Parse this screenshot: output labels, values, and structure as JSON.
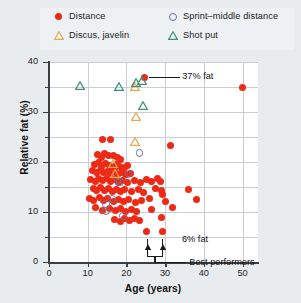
{
  "chart_data": {
    "type": "scatter",
    "title": "",
    "xlabel": "Age (years)",
    "ylabel": "Relative fat (%)",
    "xlim": [
      0,
      54
    ],
    "ylim": [
      0,
      40
    ],
    "xticks": [
      0,
      10,
      20,
      30,
      40,
      50
    ],
    "yticks": [
      0,
      10,
      20,
      30,
      40
    ],
    "yticks_minor": [
      5,
      15,
      25,
      35
    ],
    "grid": "both, light gray at every 5 units of y and every 10 units of x",
    "legend_position": "above plot, two columns",
    "series": [
      {
        "name": "Distance",
        "marker": "filled-circle",
        "color": "#ee2a17",
        "points": [
          [
            24.6,
            37.0
          ],
          [
            50.0,
            35.0
          ],
          [
            31.5,
            23.4
          ],
          [
            13.8,
            24.6
          ],
          [
            16.0,
            24.5
          ],
          [
            12.6,
            21.6
          ],
          [
            13.6,
            21.0
          ],
          [
            14.3,
            21.8
          ],
          [
            15.4,
            21.3
          ],
          [
            16.6,
            21.4
          ],
          [
            17.6,
            21.0
          ],
          [
            18.6,
            20.6
          ],
          [
            11.8,
            19.6
          ],
          [
            12.8,
            19.9
          ],
          [
            13.5,
            19.2
          ],
          [
            14.6,
            19.8
          ],
          [
            15.6,
            19.4
          ],
          [
            16.4,
            19.0
          ],
          [
            17.4,
            19.6
          ],
          [
            18.2,
            19.2
          ],
          [
            19.4,
            19.0
          ],
          [
            20.4,
            19.4
          ],
          [
            11.2,
            18.3
          ],
          [
            12.2,
            18.0
          ],
          [
            13.2,
            18.4
          ],
          [
            14.0,
            17.9
          ],
          [
            15.0,
            18.2
          ],
          [
            15.9,
            17.7
          ],
          [
            16.8,
            18.1
          ],
          [
            17.8,
            17.6
          ],
          [
            18.8,
            18.0
          ],
          [
            19.8,
            17.5
          ],
          [
            21.0,
            17.8
          ],
          [
            10.8,
            16.6
          ],
          [
            11.9,
            16.2
          ],
          [
            12.9,
            16.8
          ],
          [
            13.9,
            16.3
          ],
          [
            14.8,
            16.7
          ],
          [
            15.8,
            16.1
          ],
          [
            16.9,
            16.5
          ],
          [
            17.9,
            16.0
          ],
          [
            19.0,
            16.4
          ],
          [
            20.2,
            16.0
          ],
          [
            22.0,
            16.3
          ],
          [
            23.6,
            16.0
          ],
          [
            25.2,
            16.5
          ],
          [
            26.6,
            16.2
          ],
          [
            28.0,
            16.7
          ],
          [
            28.8,
            16.1
          ],
          [
            11.4,
            14.8
          ],
          [
            12.4,
            14.4
          ],
          [
            13.4,
            14.9
          ],
          [
            14.4,
            14.3
          ],
          [
            15.4,
            14.7
          ],
          [
            16.4,
            14.2
          ],
          [
            17.4,
            14.6
          ],
          [
            18.4,
            14.1
          ],
          [
            19.6,
            14.5
          ],
          [
            21.4,
            14.2
          ],
          [
            23.0,
            14.6
          ],
          [
            24.4,
            14.0
          ],
          [
            27.6,
            14.8
          ],
          [
            29.0,
            14.4
          ],
          [
            29.4,
            13.6
          ],
          [
            36.0,
            14.5
          ],
          [
            10.4,
            12.8
          ],
          [
            11.6,
            12.4
          ],
          [
            13.0,
            12.9
          ],
          [
            14.2,
            12.3
          ],
          [
            15.2,
            12.7
          ],
          [
            16.6,
            12.2
          ],
          [
            18.0,
            12.6
          ],
          [
            19.2,
            12.1
          ],
          [
            20.6,
            12.5
          ],
          [
            22.4,
            12.0
          ],
          [
            24.0,
            12.4
          ],
          [
            26.0,
            12.8
          ],
          [
            30.2,
            12.2
          ],
          [
            38.2,
            12.6
          ],
          [
            12.0,
            10.9
          ],
          [
            13.8,
            10.4
          ],
          [
            15.6,
            10.8
          ],
          [
            17.2,
            10.3
          ],
          [
            18.6,
            10.7
          ],
          [
            19.8,
            10.2
          ],
          [
            21.2,
            10.6
          ],
          [
            22.6,
            10.1
          ],
          [
            26.4,
            10.5
          ],
          [
            32.0,
            10.9
          ],
          [
            17.0,
            8.6
          ],
          [
            18.4,
            8.2
          ],
          [
            19.6,
            8.7
          ],
          [
            20.8,
            8.3
          ],
          [
            22.2,
            8.8
          ],
          [
            23.4,
            8.4
          ],
          [
            29.0,
            9.0
          ],
          [
            25.2,
            6.1
          ],
          [
            29.2,
            6.1
          ]
        ]
      },
      {
        "name": "Sprint–middle distance",
        "marker": "open-circle",
        "color": "#6f7398",
        "points": [
          [
            23.4,
            21.8
          ],
          [
            20.6,
            17.6
          ],
          [
            17.8,
            16.2
          ],
          [
            18.4,
            16.0
          ],
          [
            16.4,
            12.6
          ],
          [
            14.8,
            11.6
          ],
          [
            14.8,
            10.2
          ],
          [
            19.2,
            9.2
          ]
        ]
      },
      {
        "name": "Discus, javelin",
        "marker": "open-triangle",
        "color": "#e8aa45",
        "points": [
          [
            22.2,
            36.0
          ],
          [
            22.6,
            30.0
          ],
          [
            22.2,
            25.0
          ],
          [
            16.6,
            20.6
          ],
          [
            17.0,
            18.6
          ]
        ]
      },
      {
        "name": "Shot put",
        "marker": "open-triangle",
        "color": "#3c8f79",
        "points": [
          [
            8.0,
            36.2
          ],
          [
            18.0,
            36.0
          ],
          [
            22.6,
            36.8
          ],
          [
            24.0,
            37.2
          ],
          [
            24.2,
            32.2
          ]
        ]
      }
    ],
    "annotations": [
      {
        "id": "fat-37",
        "text": "37% fat",
        "target": [
          24.6,
          37.0
        ]
      },
      {
        "id": "fat-6",
        "text": "6% fat",
        "target": [
          29.2,
          6.1
        ]
      },
      {
        "id": "best-performers",
        "text": "Best performers",
        "targets": [
          [
            25.2,
            6.1
          ],
          [
            29.2,
            6.1
          ]
        ]
      }
    ]
  },
  "legend": {
    "items": [
      {
        "label": "Distance",
        "marker": "red-filled-circle-icon"
      },
      {
        "label": "Discus, javelin",
        "marker": "orange-open-triangle-icon"
      },
      {
        "label": "Sprint–middle distance",
        "marker": "blue-open-circle-icon"
      },
      {
        "label": "Shot put",
        "marker": "teal-open-triangle-icon"
      }
    ]
  },
  "axes": {
    "y_title": "Relative fat (%)",
    "x_title": "Age (years)",
    "y_tick_labels": [
      "0",
      "10",
      "20",
      "30",
      "40"
    ],
    "x_tick_labels": [
      "0",
      "10",
      "20",
      "30",
      "40",
      "50"
    ]
  },
  "annotations": {
    "fat37": "37% fat",
    "fat6": "6% fat",
    "best": "Best performers"
  },
  "colors": {
    "distance": "#ee2a17",
    "sprint": "#6f7398",
    "discus": "#e8aa45",
    "shotput": "#3c8f79",
    "grid": "#c9ced3",
    "axis": "#3a3f44",
    "page_bg": "#e9ecef",
    "plot_bg": "#ffffff"
  }
}
